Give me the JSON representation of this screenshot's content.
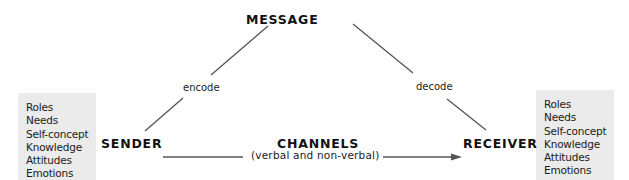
{
  "diagram": {
    "title_node": "MESSAGE",
    "sender": {
      "label": "SENDER",
      "attributes": [
        "Roles",
        "Needs",
        "Self-concept",
        "Knowledge",
        "Attitudes",
        "Emotions"
      ]
    },
    "receiver": {
      "label": "RECEIVER",
      "attributes": [
        "Roles",
        "Needs",
        "Self-concept",
        "Knowledge",
        "Attitudes",
        "Emotions"
      ]
    },
    "channels": {
      "label": "CHANNELS",
      "sublabel": "(verbal and non-verbal)"
    },
    "edges": {
      "sender_to_message": "encode",
      "message_to_receiver": "decode",
      "sender_to_receiver": "channels"
    },
    "colors": {
      "box_fill": "#ebebeb",
      "line": "#555555",
      "text": "#111111"
    }
  }
}
